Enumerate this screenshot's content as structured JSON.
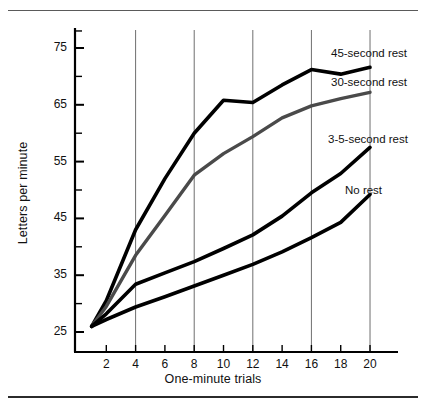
{
  "figure": {
    "top_rule": "horizontal-rule",
    "bottom_rule": "horizontal-rule"
  },
  "chart_data": {
    "type": "line",
    "title": "",
    "xlabel": "One-minute trials",
    "ylabel": "Letters per minute",
    "xlim": [
      0,
      21.5
    ],
    "ylim": [
      22,
      80
    ],
    "xticks": [
      2,
      4,
      6,
      8,
      10,
      12,
      14,
      16,
      18,
      20
    ],
    "xtick_labels": [
      "2",
      "4",
      "6",
      "8",
      "10",
      "12",
      "14",
      "16",
      "18",
      "20"
    ],
    "yticks": [
      25,
      35,
      45,
      55,
      65,
      75
    ],
    "ytick_labels": [
      "25",
      "35",
      "45",
      "55",
      "65",
      "75"
    ],
    "yticks_minor": [
      30,
      40,
      50,
      60,
      70,
      78
    ],
    "grid": "vertical",
    "gridlines_x": [
      4,
      8,
      12,
      16,
      20
    ],
    "grid_color": "#6f6f6f",
    "legend_position": "right-inline",
    "x": [
      1,
      2,
      4,
      6,
      8,
      10,
      12,
      14,
      16,
      18,
      20
    ],
    "series": [
      {
        "name": "45-second rest",
        "label": "45-second rest",
        "color": "#000000",
        "width": 3.6,
        "values": [
          26,
          30.5,
          43,
          52,
          60,
          65.8,
          65.4,
          68.5,
          71.2,
          70.4,
          71.6
        ]
      },
      {
        "name": "30-second rest",
        "label": "30-second rest",
        "color": "#4a4a4a",
        "width": 3.4,
        "values": [
          26,
          29.5,
          38.5,
          45.5,
          52.6,
          56.4,
          59.4,
          62.7,
          64.8,
          66.1,
          67.2
        ]
      },
      {
        "name": "3-5-second rest",
        "label": "3-5-second rest",
        "color": "#000000",
        "width": 3.6,
        "values": [
          26,
          28.2,
          33.4,
          35.4,
          37.4,
          39.7,
          42.1,
          45.4,
          49.5,
          52.9,
          57.5
        ]
      },
      {
        "name": "No rest",
        "label": "No rest",
        "color": "#000000",
        "width": 3.6,
        "values": [
          26,
          27.2,
          29.4,
          31.2,
          33.1,
          35,
          36.9,
          39.1,
          41.6,
          44.3,
          49.2
        ]
      }
    ],
    "series_labels": [
      {
        "text": "45-second rest",
        "x": 331,
        "y": 47
      },
      {
        "text": "30-second rest",
        "x": 331,
        "y": 76
      },
      {
        "text": "3-5-second rest",
        "x": 328,
        "y": 133
      },
      {
        "text": "No rest",
        "x": 345,
        "y": 184
      }
    ]
  }
}
